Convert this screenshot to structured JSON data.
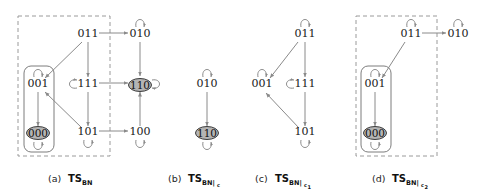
{
  "figure": {
    "colors": {
      "edge": "#8a8a8a",
      "node_text": "#1a1a1a",
      "highlight_fill": "#b4b4b4",
      "dashed_box": "#9a9a9a",
      "solid_box": "#7d7d7d",
      "background": "#ffffff"
    }
  },
  "panels": [
    {
      "id": "a",
      "caption_prefix": "(a)",
      "caption_main": "TS",
      "caption_sub": "BN",
      "caption_sub2": "",
      "nodes": [
        {
          "id": "a-011",
          "label": "011",
          "x": 88,
          "y": 36,
          "highlight": false,
          "self_loop": "none"
        },
        {
          "id": "a-010",
          "label": "010",
          "x": 140,
          "y": 36,
          "highlight": false,
          "self_loop": "top"
        },
        {
          "id": "a-001",
          "label": "001",
          "x": 38,
          "y": 86,
          "highlight": false,
          "self_loop": "top"
        },
        {
          "id": "a-111",
          "label": "111",
          "x": 88,
          "y": 86,
          "highlight": false,
          "self_loop": "left"
        },
        {
          "id": "a-110",
          "label": "110",
          "x": 140,
          "y": 86,
          "highlight": true,
          "self_loop": "right"
        },
        {
          "id": "a-000",
          "label": "000",
          "x": 38,
          "y": 134,
          "highlight": true,
          "self_loop": "bottom"
        },
        {
          "id": "a-101",
          "label": "101",
          "x": 88,
          "y": 134,
          "highlight": false,
          "self_loop": "bottom"
        },
        {
          "id": "a-100",
          "label": "100",
          "x": 140,
          "y": 134,
          "highlight": false,
          "self_loop": "bottom"
        }
      ],
      "edges": [
        {
          "from": "011",
          "to": "010"
        },
        {
          "from": "011",
          "to": "001"
        },
        {
          "from": "011",
          "to": "111"
        },
        {
          "from": "111",
          "to": "110"
        },
        {
          "from": "111",
          "to": "101"
        },
        {
          "from": "101",
          "to": "001"
        },
        {
          "from": "101",
          "to": "100"
        },
        {
          "from": "010",
          "to": "110"
        },
        {
          "from": "100",
          "to": "110"
        },
        {
          "from": "001",
          "to": "000"
        }
      ],
      "dashed_region": {
        "x": 18,
        "y": 16,
        "w": 92,
        "h": 140
      },
      "solid_region": {
        "x": 24,
        "y": 66,
        "w": 30,
        "h": 86
      }
    },
    {
      "id": "b",
      "caption_prefix": "(b)",
      "caption_main": "TS",
      "caption_sub": "BN|",
      "caption_sub2": "c",
      "nodes": [
        {
          "id": "b-010",
          "label": "010",
          "x": 207,
          "y": 86,
          "highlight": false,
          "self_loop": "top"
        },
        {
          "id": "b-110",
          "label": "110",
          "x": 207,
          "y": 134,
          "highlight": true,
          "self_loop": "bottom"
        }
      ],
      "edges": [
        {
          "from": "010",
          "to": "110"
        }
      ],
      "dashed_region": null,
      "solid_region": null
    },
    {
      "id": "c",
      "caption_prefix": "(c)",
      "caption_main": "TS",
      "caption_sub": "BN|",
      "caption_sub2": "c1",
      "nodes": [
        {
          "id": "c-011",
          "label": "011",
          "x": 305,
          "y": 36,
          "highlight": false,
          "self_loop": "top"
        },
        {
          "id": "c-001",
          "label": "001",
          "x": 262,
          "y": 86,
          "highlight": false,
          "self_loop": "top"
        },
        {
          "id": "c-111",
          "label": "111",
          "x": 305,
          "y": 86,
          "highlight": false,
          "self_loop": "left"
        },
        {
          "id": "c-101",
          "label": "101",
          "x": 305,
          "y": 134,
          "highlight": false,
          "self_loop": "bottom"
        }
      ],
      "edges": [
        {
          "from": "011",
          "to": "001"
        },
        {
          "from": "011",
          "to": "111"
        },
        {
          "from": "111",
          "to": "101"
        },
        {
          "from": "101",
          "to": "001"
        }
      ],
      "dashed_region": null,
      "solid_region": null
    },
    {
      "id": "d",
      "caption_prefix": "(d)",
      "caption_main": "TS",
      "caption_sub": "BN|",
      "caption_sub2": "c2",
      "nodes": [
        {
          "id": "d-011",
          "label": "011",
          "x": 411,
          "y": 36,
          "highlight": false,
          "self_loop": "top"
        },
        {
          "id": "d-010",
          "label": "010",
          "x": 458,
          "y": 36,
          "highlight": false,
          "self_loop": "top"
        },
        {
          "id": "d-001",
          "label": "001",
          "x": 375,
          "y": 86,
          "highlight": false,
          "self_loop": "top"
        },
        {
          "id": "d-000",
          "label": "000",
          "x": 375,
          "y": 134,
          "highlight": true,
          "self_loop": "bottom"
        }
      ],
      "edges": [
        {
          "from": "011",
          "to": "010"
        },
        {
          "from": "011",
          "to": "001"
        },
        {
          "from": "001",
          "to": "000"
        }
      ],
      "dashed_region": {
        "x": 356,
        "y": 16,
        "w": 81,
        "h": 140
      },
      "solid_region": {
        "x": 361,
        "y": 66,
        "w": 30,
        "h": 86
      }
    }
  ],
  "captions": [
    {
      "prefix": "(a)",
      "ts": "TS",
      "sub": "BN",
      "sub2": "",
      "x": 64,
      "y": 182
    },
    {
      "prefix": "(b)",
      "ts": "TS",
      "sub": "BN|",
      "sub2": "c",
      "x": 183,
      "y": 182
    },
    {
      "prefix": "(c)",
      "ts": "TS",
      "sub": "BN|",
      "sub2": "c",
      "sub3": "1",
      "x": 256,
      "y": 182
    },
    {
      "prefix": "(d)",
      "ts": "TS",
      "sub": "BN|",
      "sub2": "c",
      "sub3": "2",
      "x": 380,
      "y": 182
    }
  ]
}
